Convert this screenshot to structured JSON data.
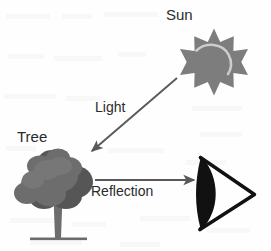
{
  "diagram": {
    "background_color": "#fefefe",
    "width": 271,
    "height": 251,
    "labels": {
      "sun": "Sun",
      "tree": "Tree",
      "light": "Light",
      "reflection": "Reflection"
    },
    "nodes": [
      {
        "id": "sun",
        "icon": "sun-icon",
        "label": "Sun",
        "shape": "12-point star with crescent highlight",
        "fill_color": "#7d7d7d",
        "highlight_color": "#cfcfcf",
        "center_x": 214,
        "center_y": 62
      },
      {
        "id": "tree",
        "icon": "tree-icon",
        "label": "Tree",
        "shape": "cluster of rounded foliage blobs on forked trunk",
        "foliage_color": "#6d6d6d",
        "foliage_shadow_color": "#525252",
        "trunk_color": "#6d6d6d",
        "center_x": 57,
        "center_y": 190
      },
      {
        "id": "eye",
        "icon": "eye-icon",
        "label": "",
        "shape": "hand drawn triangle with filled lens, apex pointing right",
        "stroke_color": "#111111",
        "center_x": 222,
        "center_y": 193
      }
    ],
    "arrows": [
      {
        "id": "light-arrow",
        "label": "Light",
        "from": "sun",
        "to": "tree",
        "color": "#595959",
        "x1": 177,
        "y1": 78,
        "x2": 90,
        "y2": 153,
        "direction": "down-left"
      },
      {
        "id": "reflection-arrow",
        "label": "Reflection",
        "from": "tree",
        "to": "eye",
        "color": "#595959",
        "x1": 95,
        "y1": 180,
        "x2": 197,
        "y2": 180,
        "direction": "right"
      }
    ]
  }
}
